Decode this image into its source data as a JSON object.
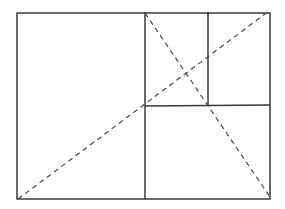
{
  "diagram": {
    "title": "",
    "colors": {
      "background": "#ffffff",
      "stroke": "#3a3a3a",
      "dashed": "#4a4a4a"
    },
    "outer_rect": {
      "x1": 17,
      "y1": 13,
      "x2": 270,
      "y2": 199
    },
    "lines": [
      {
        "name": "vertical-divider-main",
        "x1": 145,
        "y1": 12,
        "x2": 145,
        "y2": 199
      },
      {
        "name": "horizontal-divider-right",
        "x1": 145,
        "y1": 106,
        "x2": 270,
        "y2": 105
      },
      {
        "name": "vertical-divider-upper",
        "x1": 208,
        "y1": 12,
        "x2": 208,
        "y2": 106
      }
    ],
    "dashed_lines": [
      {
        "name": "diagonal-bottom-left-to-top-right",
        "x1": 18,
        "y1": 199,
        "x2": 269,
        "y2": 11
      },
      {
        "name": "diagonal-top-mid-to-bottom-right",
        "x1": 145,
        "y1": 13,
        "x2": 270,
        "y2": 197
      }
    ]
  }
}
